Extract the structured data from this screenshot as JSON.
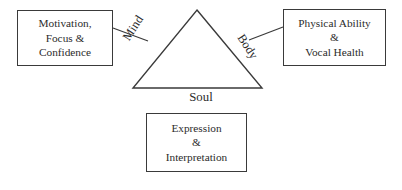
{
  "diagram": {
    "type": "triangle-concept-model",
    "background_color": "#ffffff",
    "stroke_color": "#3a3a3a",
    "text_color": "#2b2b2b"
  },
  "triangle": {
    "apex": {
      "x": 197,
      "y": 10
    },
    "base_left": {
      "x": 133,
      "y": 88
    },
    "base_right": {
      "x": 262,
      "y": 88
    },
    "vertices_label": "triangle"
  },
  "edge_labels": {
    "left": "Mind",
    "right": "Body",
    "bottom": "Soul"
  },
  "boxes": {
    "mind": {
      "name": "Motivation, Focus & Confidence",
      "lines": [
        "Motivation,",
        "Focus &",
        "Confidence"
      ]
    },
    "body": {
      "name": "Physical Ability & Vocal Health",
      "lines": [
        "Physical Ability",
        "&",
        "Vocal Health"
      ]
    },
    "soul": {
      "name": "Expression & Interpretation",
      "lines": [
        "Expression",
        "&",
        "Interpretation"
      ]
    }
  },
  "connectors": [
    {
      "id": "mind-connector",
      "from": {
        "x": 113,
        "y": 28
      },
      "to": {
        "x": 148,
        "y": 41
      }
    },
    {
      "id": "body-connector",
      "from": {
        "x": 249,
        "y": 40
      },
      "to": {
        "x": 283,
        "y": 27
      }
    }
  ]
}
